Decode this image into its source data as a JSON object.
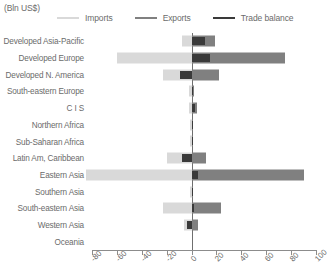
{
  "units_note": "(Bln US$)",
  "legend": {
    "items": [
      {
        "label": "Imports",
        "color": "#d9d9d9",
        "key": "imports"
      },
      {
        "label": "Exports",
        "color": "#808080",
        "key": "exports"
      },
      {
        "label": "Trade balance",
        "color": "#3a3a3a",
        "key": "balance"
      }
    ]
  },
  "chart_data": {
    "type": "bar",
    "orientation": "horizontal",
    "title": "",
    "subtitle": "",
    "xlabel": "",
    "ylabel": "",
    "units": "(Bln US$)",
    "xlim": [
      -80,
      100
    ],
    "xticks": [
      -80,
      -60,
      -40,
      -20,
      0,
      20,
      40,
      60,
      80,
      100
    ],
    "xticklabels": [
      "-80",
      "-60",
      "-40",
      "-20",
      "0",
      "20",
      "40",
      "60",
      "80",
      "100"
    ],
    "grid": false,
    "legend_position": "top",
    "zero_line": 0,
    "categories": [
      "Developed Asia-Pacific",
      "Developed Europe",
      "Developed N. America",
      "South-eastern Europe",
      "C I S",
      "Northern Africa",
      "Sub-Saharan Africa",
      "Latin Am, Caribbean",
      "Eastern Asia",
      "Southern Asia",
      "South-eastern Asia",
      "Western Asia",
      "Oceania"
    ],
    "series": [
      {
        "name": "Imports",
        "color": "#d9d9d9",
        "values": [
          -8,
          -60,
          -23,
          -2,
          -2,
          -1,
          -1,
          -20,
          -85,
          -1,
          -23,
          -6,
          0
        ]
      },
      {
        "name": "Exports",
        "color": "#808080",
        "values": [
          19,
          75,
          22,
          2,
          4,
          1,
          1,
          12,
          90,
          1,
          24,
          5,
          0
        ]
      },
      {
        "name": "Trade balance",
        "color": "#3a3a3a",
        "values": [
          11,
          15,
          -9,
          1,
          3,
          1,
          1,
          -8,
          5,
          1,
          2,
          -4,
          0
        ]
      }
    ]
  }
}
